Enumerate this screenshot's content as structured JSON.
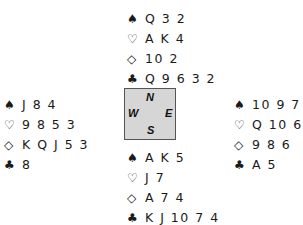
{
  "suits": {
    "spades": "♠",
    "hearts": "♡",
    "diamonds": "◇",
    "clubs": "♣"
  },
  "hands": {
    "north": {
      "spades": "Q 3 2",
      "hearts": "A K 4",
      "diamonds": "10 2",
      "clubs": "Q 9 6 3 2"
    },
    "west": {
      "spades": "J 8 4",
      "hearts": "9 8 5 3",
      "diamonds": "K Q J 5 3",
      "clubs": "8"
    },
    "east": {
      "spades": "10 9 7 6",
      "hearts": "Q 10 6 2",
      "diamonds": "9 8 6",
      "clubs": "A 5"
    },
    "south": {
      "spades": "A K 5",
      "hearts": "J 7",
      "diamonds": "A 7 4",
      "clubs": "K J 10 7 4"
    }
  },
  "compass": {
    "n": "N",
    "s": "S",
    "e": "E",
    "w": "W"
  }
}
